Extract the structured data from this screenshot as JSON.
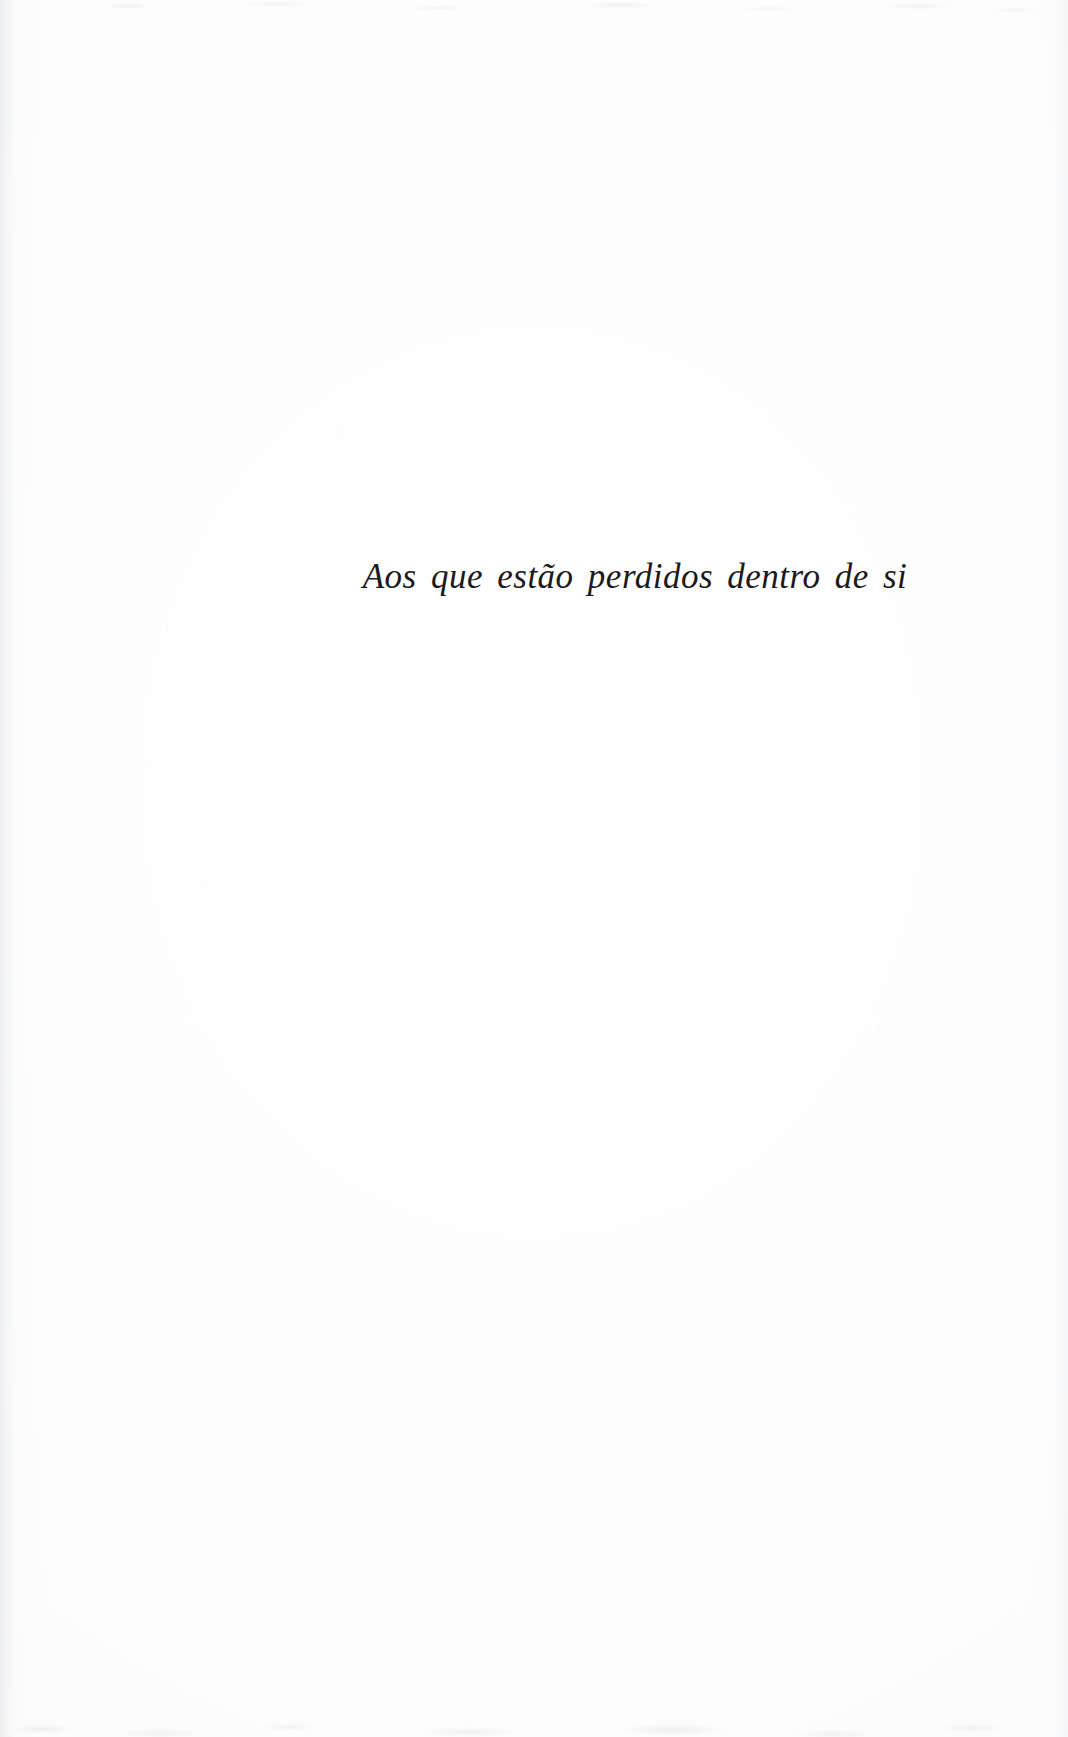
{
  "page": {
    "kind": "book-dedication-page",
    "language": "pt-BR",
    "background_color": "#fdfdfd",
    "text_color": "#1a1a20"
  },
  "dedication": {
    "text": "Aos que estão perdidos dentro de si",
    "style": "italic-serif",
    "alignment": "right-of-center"
  }
}
